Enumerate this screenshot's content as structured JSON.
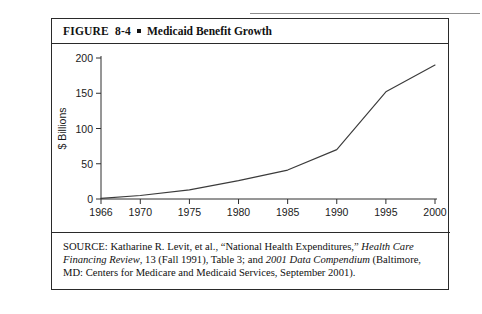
{
  "figure": {
    "label": "FIGURE  8-4",
    "bullet_icon": "square-bullet-icon",
    "title": "Medicaid Benefit Growth"
  },
  "source": {
    "prefix": "SOURCE: Katharine R. Levit, et al., “National Health Expenditures,” ",
    "journal": "Health Care Financing Review",
    "mid": ", 13 (Fall 1991), Table 3; and ",
    "publication": "2001 Data Compendium",
    "suffix": " (Baltimore, MD: Centers for Medicare and Medicaid Services, September 2001)."
  },
  "chart_data": {
    "type": "line",
    "title": "Medicaid Benefit Growth",
    "xlabel": "",
    "ylabel": "$ Billions",
    "x": [
      1966,
      1970,
      1975,
      1980,
      1985,
      1990,
      1995,
      2000
    ],
    "values": [
      0.9,
      5,
      13,
      26,
      41,
      70,
      152,
      190
    ],
    "series": [
      {
        "name": "Medicaid benefit payments",
        "values": [
          0.9,
          5,
          13,
          26,
          41,
          70,
          152,
          190
        ]
      }
    ],
    "xtick_labels": [
      "1966",
      "1970",
      "1975",
      "1980",
      "1985",
      "1990",
      "1995",
      "2000"
    ],
    "ytick_labels": [
      "0",
      "50",
      "100",
      "150",
      "200"
    ],
    "yticks": [
      0,
      50,
      100,
      150,
      200
    ],
    "xlim": [
      1966,
      2000
    ],
    "ylim": [
      0,
      200
    ],
    "grid": false,
    "legend": "none",
    "line_color": "#3b3b3b"
  }
}
